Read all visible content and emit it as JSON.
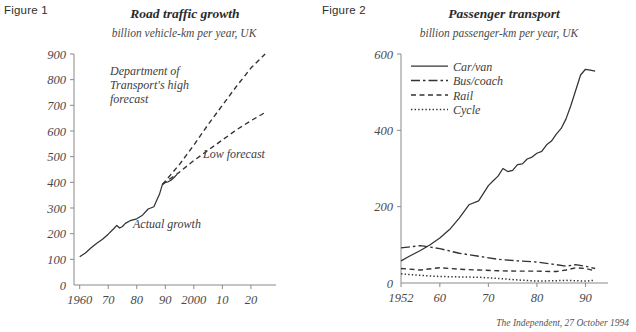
{
  "credit": "The Independent, 27 October 1994",
  "figure1": {
    "label": "Figure 1",
    "title": "Road traffic growth",
    "subtitle": "billion vehicle-km per year, UK",
    "annotations": {
      "high_forecast": "Department of\nTransport's high\nforecast",
      "high_forecast_line1": "Department of",
      "high_forecast_line2": "Transport's high",
      "high_forecast_line3": "forecast",
      "low_forecast": "Low forecast",
      "actual": "Actual growth"
    }
  },
  "figure2": {
    "label": "Figure 2",
    "title": "Passenger transport",
    "subtitle": "billion passenger-km per year, UK",
    "legend": [
      {
        "label": "Car/van",
        "style": "solid"
      },
      {
        "label": "Bus/coach",
        "style": "dashdot"
      },
      {
        "label": "Rail",
        "style": "dashed"
      },
      {
        "label": "Cycle",
        "style": "dotted"
      }
    ]
  },
  "chart_data": [
    {
      "type": "line",
      "id": "figure1",
      "title": "Road traffic growth",
      "subtitle": "billion vehicle-km per year, UK",
      "xlabel": "",
      "ylabel": "billion vehicle-km per year",
      "xlim": [
        1958,
        2026
      ],
      "ylim": [
        0,
        900
      ],
      "xticks": [
        1960,
        1970,
        1980,
        1990,
        2000,
        2010,
        2020
      ],
      "xticklabels": [
        "1960",
        "70",
        "80",
        "90",
        "2000",
        "10",
        "20"
      ],
      "yticks": [
        0,
        100,
        200,
        300,
        400,
        500,
        600,
        700,
        800,
        900
      ],
      "yticklabels": [
        "0",
        "100",
        "200",
        "300",
        "400",
        "500",
        "600",
        "700",
        "800",
        "900"
      ],
      "grid": false,
      "legend": "none",
      "series": [
        {
          "name": "Actual growth",
          "style": "solid",
          "x": [
            1960,
            1962,
            1964,
            1966,
            1968,
            1970,
            1972,
            1973,
            1974,
            1975,
            1976,
            1978,
            1980,
            1982,
            1984,
            1986,
            1987,
            1988,
            1989,
            1990,
            1991,
            1992,
            1993,
            1994
          ],
          "y": [
            110,
            125,
            145,
            163,
            178,
            198,
            220,
            232,
            222,
            228,
            240,
            252,
            258,
            272,
            296,
            305,
            330,
            355,
            392,
            400,
            402,
            408,
            418,
            430
          ]
        },
        {
          "name": "Department of Transport's high forecast",
          "style": "dashed",
          "x": [
            1989,
            1995,
            2000,
            2005,
            2010,
            2015,
            2020,
            2025
          ],
          "y": [
            392,
            470,
            545,
            625,
            700,
            775,
            845,
            900
          ]
        },
        {
          "name": "Low forecast",
          "style": "dashed",
          "x": [
            1989,
            1995,
            2000,
            2005,
            2010,
            2015,
            2020,
            2025
          ],
          "y": [
            392,
            440,
            485,
            525,
            565,
            605,
            640,
            672
          ]
        }
      ]
    },
    {
      "type": "line",
      "id": "figure2",
      "title": "Passenger transport",
      "subtitle": "billion passenger-km per year, UK",
      "xlabel": "",
      "ylabel": "billion passenger-km per year",
      "xlim": [
        1952,
        1993
      ],
      "ylim": [
        0,
        600
      ],
      "xticks": [
        1952,
        1960,
        1970,
        1980,
        1990
      ],
      "xticklabels": [
        "1952",
        "60",
        "70",
        "80",
        "90"
      ],
      "yticks": [
        0,
        200,
        400,
        600
      ],
      "yticklabels": [
        "0",
        "200",
        "400",
        "600"
      ],
      "grid": false,
      "legend": "upper-left-inside",
      "series": [
        {
          "name": "Car/van",
          "style": "solid",
          "x": [
            1952,
            1954,
            1956,
            1958,
            1960,
            1962,
            1964,
            1966,
            1968,
            1970,
            1971,
            1972,
            1973,
            1974,
            1975,
            1976,
            1977,
            1978,
            1979,
            1980,
            1981,
            1982,
            1983,
            1984,
            1985,
            1986,
            1987,
            1988,
            1989,
            1990,
            1991,
            1992
          ],
          "y": [
            58,
            72,
            85,
            100,
            118,
            140,
            170,
            205,
            215,
            255,
            268,
            280,
            300,
            292,
            295,
            310,
            312,
            325,
            330,
            340,
            345,
            362,
            372,
            390,
            405,
            430,
            465,
            505,
            545,
            560,
            558,
            555
          ]
        },
        {
          "name": "Bus/coach",
          "style": "dashdot",
          "x": [
            1952,
            1956,
            1960,
            1964,
            1968,
            1972,
            1976,
            1980,
            1984,
            1986,
            1988,
            1990,
            1992
          ],
          "y": [
            92,
            98,
            90,
            78,
            70,
            62,
            58,
            55,
            48,
            44,
            48,
            44,
            38
          ]
        },
        {
          "name": "Rail",
          "style": "dashed",
          "x": [
            1952,
            1956,
            1960,
            1964,
            1968,
            1972,
            1976,
            1980,
            1984,
            1986,
            1988,
            1990,
            1992
          ],
          "y": [
            38,
            34,
            40,
            36,
            34,
            32,
            31,
            31,
            30,
            34,
            40,
            38,
            32
          ]
        },
        {
          "name": "Cycle",
          "style": "dotted",
          "x": [
            1952,
            1956,
            1960,
            1964,
            1968,
            1972,
            1976,
            1980,
            1984,
            1986,
            1988,
            1990,
            1992
          ],
          "y": [
            24,
            20,
            17,
            16,
            15,
            12,
            8,
            5,
            6,
            7,
            6,
            5,
            7
          ]
        }
      ]
    }
  ]
}
